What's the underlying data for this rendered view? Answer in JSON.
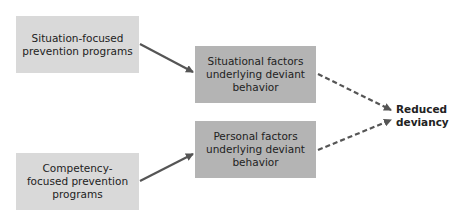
{
  "diagram": {
    "nodes": [
      {
        "id": "situation_programs",
        "label": "Situation-focused prevention programs"
      },
      {
        "id": "situational_factors",
        "label": "Situational factors underlying deviant behavior"
      },
      {
        "id": "personal_factors",
        "label": "Personal factors underlying deviant behavior"
      },
      {
        "id": "competency_programs",
        "label": "Competency-focused prevention programs"
      },
      {
        "id": "outcome",
        "label": "Reduced deviancy"
      }
    ],
    "edges": [
      {
        "from": "situation_programs",
        "to": "situational_factors",
        "style": "solid"
      },
      {
        "from": "competency_programs",
        "to": "personal_factors",
        "style": "solid"
      },
      {
        "from": "situational_factors",
        "to": "outcome",
        "style": "dashed"
      },
      {
        "from": "personal_factors",
        "to": "outcome",
        "style": "dashed"
      }
    ],
    "colors": {
      "program_box": "#d9d9d9",
      "factor_box": "#b4b4b4",
      "arrow": "#555555"
    }
  }
}
